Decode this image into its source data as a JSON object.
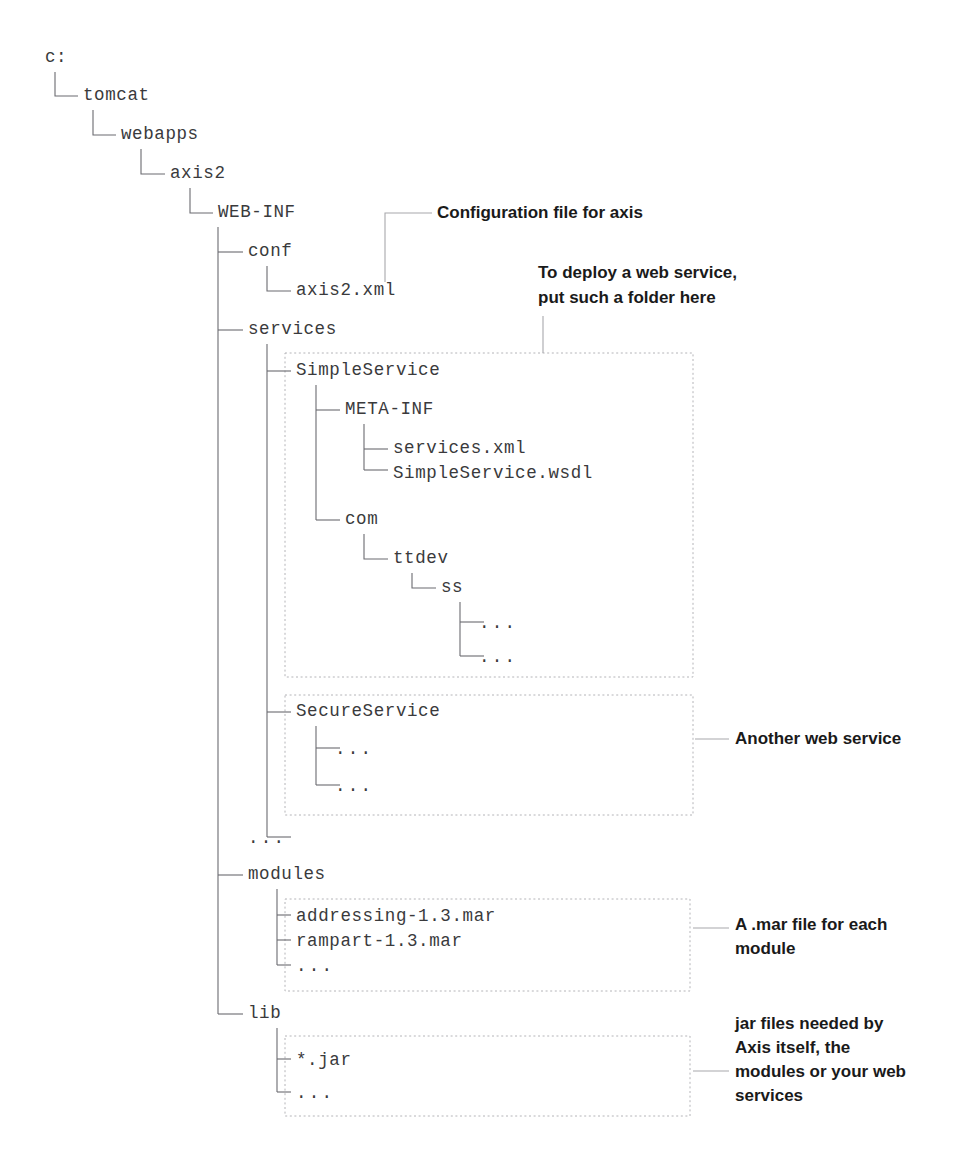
{
  "diagram": {
    "type": "directory-tree",
    "colors": {
      "background": "#ffffff",
      "tree_text": "#3a3a3c",
      "annotation_text": "#1a1a1a",
      "connector_line": "#6b6b70",
      "leader_line": "#a8a8ac",
      "dotted_box": "#b4b4b8"
    }
  },
  "tree": {
    "nodes": [
      {
        "id": "root",
        "label": "c:",
        "x": 45,
        "y": 62
      },
      {
        "id": "tomcat",
        "label": "tomcat",
        "x": 83,
        "y": 100
      },
      {
        "id": "webapps",
        "label": "webapps",
        "x": 121,
        "y": 139
      },
      {
        "id": "axis2",
        "label": "axis2",
        "x": 170,
        "y": 178
      },
      {
        "id": "webinf",
        "label": "WEB-INF",
        "x": 218,
        "y": 217
      },
      {
        "id": "conf",
        "label": "conf",
        "x": 248,
        "y": 256
      },
      {
        "id": "axis2xml",
        "label": "axis2.xml",
        "x": 296,
        "y": 295
      },
      {
        "id": "services",
        "label": "services",
        "x": 248,
        "y": 334
      },
      {
        "id": "simpleservice",
        "label": "SimpleService",
        "x": 296,
        "y": 375
      },
      {
        "id": "metainf",
        "label": "META-INF",
        "x": 345,
        "y": 414
      },
      {
        "id": "servicesxml",
        "label": "services.xml",
        "x": 393,
        "y": 453
      },
      {
        "id": "simpleservicewsdl",
        "label": "SimpleService.wsdl",
        "x": 393,
        "y": 474
      },
      {
        "id": "com",
        "label": "com",
        "x": 345,
        "y": 524
      },
      {
        "id": "ttdev",
        "label": "ttdev",
        "x": 393,
        "y": 563
      },
      {
        "id": "ss",
        "label": "ss",
        "x": 441,
        "y": 592
      },
      {
        "id": "ss-dots-1",
        "label": "...",
        "x": 479,
        "y": 626
      },
      {
        "id": "ss-dots-2",
        "label": "...",
        "x": 479,
        "y": 660
      },
      {
        "id": "secureservice",
        "label": "SecureService",
        "x": 296,
        "y": 716
      },
      {
        "id": "sec-dots-1",
        "label": "...",
        "x": 335,
        "y": 752
      },
      {
        "id": "sec-dots-2",
        "label": "...",
        "x": 335,
        "y": 789
      },
      {
        "id": "services-dots",
        "label": "...",
        "x": 248,
        "y": 841
      },
      {
        "id": "modules",
        "label": "modules",
        "x": 248,
        "y": 879
      },
      {
        "id": "addressing",
        "label": "addressing-1.3.mar",
        "x": 296,
        "y": 919
      },
      {
        "id": "rampart",
        "label": "rampart-1.3.mar",
        "x": 296,
        "y": 944
      },
      {
        "id": "modules-dots",
        "label": "...",
        "x": 296,
        "y": 969
      },
      {
        "id": "lib",
        "label": "lib",
        "x": 248,
        "y": 1018
      },
      {
        "id": "starjar",
        "label": "*.jar",
        "x": 296,
        "y": 1063
      },
      {
        "id": "lib-dots",
        "label": "...",
        "x": 296,
        "y": 1096
      }
    ]
  },
  "boxes": [
    {
      "id": "box-simpleservice",
      "x": 285,
      "y": 353,
      "w": 408,
      "h": 324
    },
    {
      "id": "box-secureservice",
      "x": 285,
      "y": 695,
      "w": 408,
      "h": 120
    },
    {
      "id": "box-modules",
      "x": 285,
      "y": 899,
      "w": 405,
      "h": 92
    },
    {
      "id": "box-lib",
      "x": 285,
      "y": 1036,
      "w": 405,
      "h": 80
    }
  ],
  "annotations": [
    {
      "id": "anno-config",
      "lines": [
        "Configuration file for axis"
      ],
      "x": 437,
      "y": 218
    },
    {
      "id": "anno-deploy",
      "lines": [
        "To deploy a web service,",
        "put such a folder here"
      ],
      "x": 538,
      "y": 278
    },
    {
      "id": "anno-another",
      "lines": [
        "Another web service"
      ],
      "x": 735,
      "y": 744
    },
    {
      "id": "anno-mar",
      "lines": [
        "A .mar file for each",
        "module"
      ],
      "x": 735,
      "y": 930
    },
    {
      "id": "anno-jar",
      "lines": [
        "jar files needed by",
        "Axis itself, the",
        "modules or your web",
        "services"
      ],
      "x": 735,
      "y": 1029
    }
  ]
}
